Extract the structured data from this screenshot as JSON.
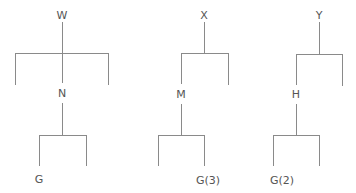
{
  "diagram": {
    "type": "syntax-trees",
    "trees": [
      {
        "root": "W",
        "child": "N",
        "leaf": "G",
        "structure": "W branches into three: left leg, N (center), right leg; N branches into two legs; G under left leg"
      },
      {
        "root": "X",
        "child": "M",
        "leaf": "G(3)",
        "structure": "X branches into M (left) and right leg; M branches into two legs; G(3) under right leg"
      },
      {
        "root": "Y",
        "child": "H",
        "leaf": "G(2)",
        "structure": "Y branches into H (left) and right leg; H branches into two legs; G(2) under left leg"
      }
    ],
    "colors": {
      "line": "#8a8a8a",
      "text": "#555555",
      "background": "#ffffff"
    }
  }
}
